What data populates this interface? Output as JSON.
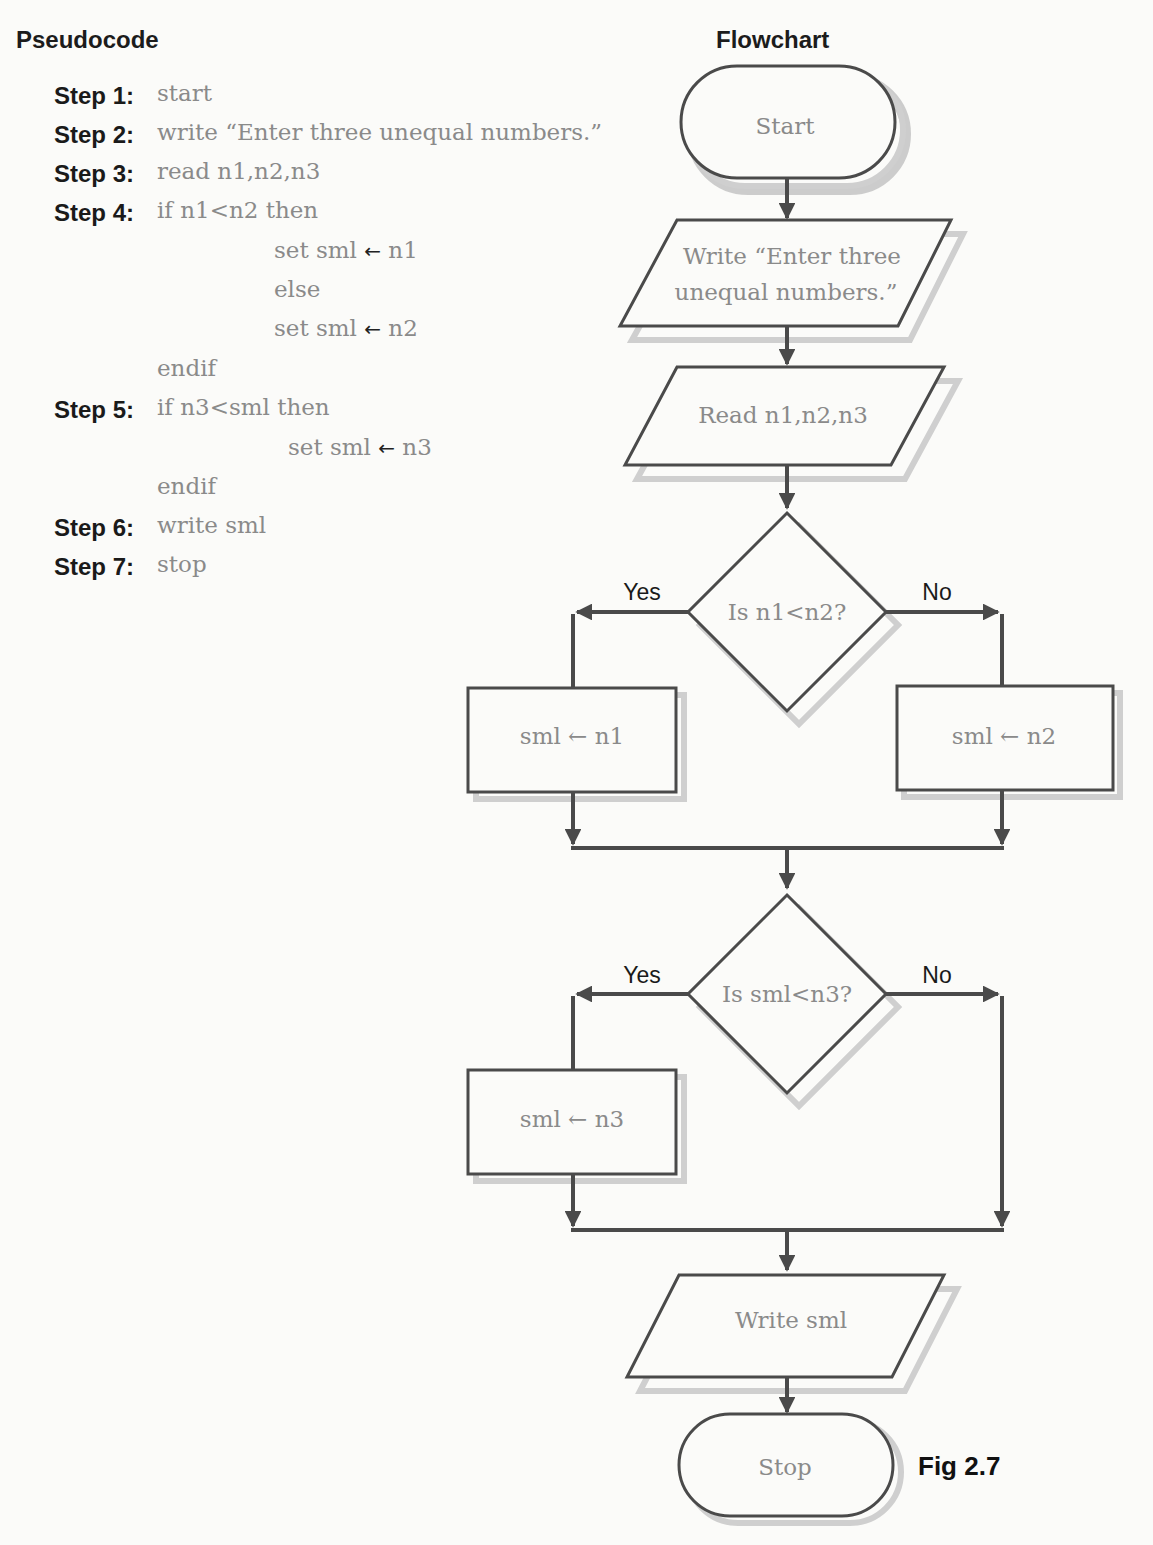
{
  "pseudocode": {
    "title": "Pseudocode",
    "lines": [
      {
        "label": "Step 1:",
        "code": "start",
        "indent": 103,
        "top": 0
      },
      {
        "label": "Step 2:",
        "code": "write “Enter three unequal numbers.”",
        "indent": 103,
        "top": 39
      },
      {
        "label": "Step 3:",
        "code": "read n1,n2,n3",
        "indent": 103,
        "top": 78
      },
      {
        "label": "Step 4:",
        "code": "if n1<n2 then",
        "indent": 103,
        "top": 117
      },
      {
        "label": "",
        "code": "set sml",
        "arrow": "←",
        "rhs": "n1",
        "indent": 220,
        "top": 157
      },
      {
        "label": "",
        "code": "else",
        "indent": 220,
        "top": 196
      },
      {
        "label": "",
        "code": "set sml",
        "arrow": "←",
        "rhs": "n2",
        "indent": 220,
        "top": 235
      },
      {
        "label": "",
        "code": "endif",
        "indent": 103,
        "top": 275
      },
      {
        "label": "Step 5:",
        "code": "if n3<sml then",
        "indent": 103,
        "top": 314
      },
      {
        "label": "",
        "code": "set sml",
        "arrow": "←",
        "rhs": "n3",
        "indent": 234,
        "top": 354
      },
      {
        "label": "",
        "code": "endif",
        "indent": 103,
        "top": 393
      },
      {
        "label": "Step 6:",
        "code": "write sml",
        "indent": 103,
        "top": 432
      },
      {
        "label": "Step 7:",
        "code": "stop",
        "indent": 103,
        "top": 471
      }
    ]
  },
  "flowchart": {
    "title": "Flowchart",
    "start": "Start",
    "write_prompt_line1": "Write “Enter three",
    "write_prompt_line2": "unequal numbers.”",
    "read": "Read n1,n2,n3",
    "decision1": "Is n1<n2?",
    "decision1_yes": "Yes",
    "decision1_no": "No",
    "assign_n1": "sml ← n1",
    "assign_n2": "sml ← n2",
    "decision2": "Is sml<n3?",
    "decision2_yes": "Yes",
    "decision2_no": "No",
    "assign_n3": "sml ← n3",
    "write_sml": "Write sml",
    "stop": "Stop"
  },
  "figure_label": "Fig 2.7",
  "colors": {
    "stroke": "#4a4a4a",
    "shadow": "#c8c8c8",
    "node_text": "#8a8a8a",
    "label_text": "#1a1a1a"
  }
}
